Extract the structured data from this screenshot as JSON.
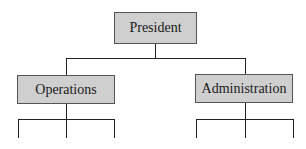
{
  "chart": {
    "type": "org-chart",
    "root": {
      "label": "President",
      "children": [
        {
          "label": "Operations",
          "sub_branches": 3
        },
        {
          "label": "Administration",
          "sub_branches": 3
        }
      ]
    }
  },
  "colors": {
    "box_fill": "#cfcfcf",
    "box_border": "#555555",
    "line": "#222222"
  }
}
